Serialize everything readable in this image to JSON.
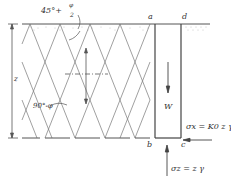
{
  "diagram": {
    "labels": {
      "angle_top": "45° + φ/2",
      "angle_top_main": "45°+",
      "angle_top_num": "φ",
      "angle_top_den": "2",
      "angle_mid": "90°-φ",
      "depth": "z",
      "corner_a": "a",
      "corner_b": "b",
      "corner_c": "c",
      "corner_d": "d",
      "weight": "W",
      "sigma_x": "σx = K0 z γ",
      "sigma_z": "σz = z γ"
    },
    "colors": {
      "line": "#555555",
      "text": "#333333",
      "background": "#ffffff"
    }
  }
}
